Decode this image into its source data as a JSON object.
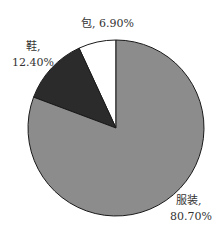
{
  "chart_data": {
    "type": "pie",
    "title": "",
    "start": "top",
    "direction": "counterclockwise",
    "slices": [
      {
        "label": "包",
        "value": 6.9,
        "display": "包, 6.90%",
        "color": "#ffffff"
      },
      {
        "label": "鞋",
        "value": 12.4,
        "display_line1": "鞋,",
        "display_line2": "12.40%",
        "color": "#2b2b2b"
      },
      {
        "label": "服装",
        "value": 80.7,
        "display_line1": "服装,",
        "display_line2": "80.70%",
        "color": "#8c8c8c"
      }
    ],
    "legend": "none"
  }
}
